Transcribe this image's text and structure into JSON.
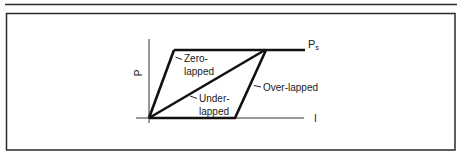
{
  "figure": {
    "axes": {
      "y_label": "P",
      "x_label": "I",
      "supply_label_main": "P",
      "supply_label_sub": "s"
    },
    "curves": [
      {
        "name": "Zero-lapped",
        "label_line1": "Zero-",
        "label_line2": "lapped"
      },
      {
        "name": "Under-lapped",
        "label_line1": "Under-",
        "label_line2": "lapped"
      },
      {
        "name": "Over-lapped",
        "label_line1": "Over-lapped"
      }
    ],
    "colors": {
      "line": "#111111",
      "frame": "#2a2a2a",
      "background": "#ffffff"
    }
  }
}
